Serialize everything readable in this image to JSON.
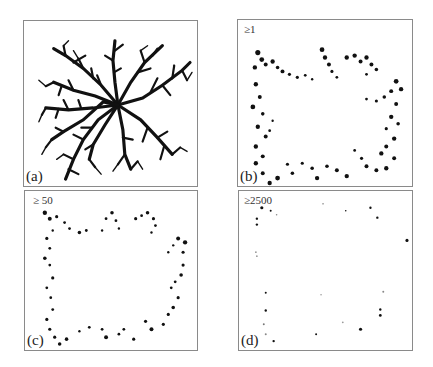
{
  "figure": {
    "panels": [
      {
        "id": "a",
        "label": "(a)",
        "threshold": "",
        "description": "DLA-like branching cluster with ~8 arms radiating from center"
      },
      {
        "id": "b",
        "label": "(b)",
        "threshold": "≥1",
        "description": "Growth sites on cluster perimeter, roughly square ring of tips"
      },
      {
        "id": "c",
        "label": "(c)",
        "threshold": "≥ 50",
        "description": "Sparser perimeter points forming square-ish ring"
      },
      {
        "id": "d",
        "label": "(d)",
        "threshold": "≥2500",
        "description": "Very sparse isolated dots along perimeter"
      }
    ]
  },
  "colors": {
    "ink": "#111111",
    "border": "#8a8a8a",
    "background": "#ffffff"
  }
}
